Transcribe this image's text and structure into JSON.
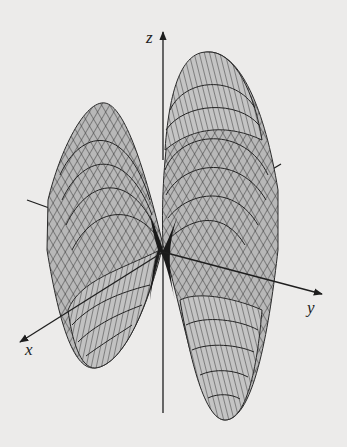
{
  "figure": {
    "type": "3d-surface",
    "axes": {
      "x_label": "x",
      "y_label": "y",
      "z_label": "z"
    },
    "colors": {
      "background": "#ecebea",
      "surface_fill": "#b5b5b5",
      "surface_fill_light": "#c9c9c9",
      "mesh_line": "#2a2a2a",
      "axis": "#1e1e1e"
    }
  }
}
